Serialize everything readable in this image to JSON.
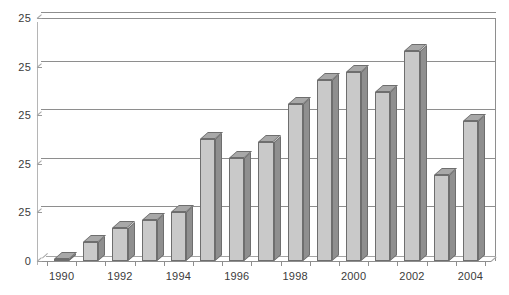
{
  "chart_data": {
    "type": "bar",
    "title": "",
    "xlabel": "",
    "ylabel": "",
    "grid": true,
    "legend": false,
    "three_d": true,
    "categories": [
      "1990",
      "1991",
      "1992",
      "1993",
      "1994",
      "1995",
      "1996",
      "1997",
      "1998",
      "1999",
      "2000",
      "2001",
      "2002",
      "2003",
      "2004"
    ],
    "x_tick_labels": [
      "1990",
      "1992",
      "1994",
      "1996",
      "1998",
      "2000",
      "2002",
      "2004"
    ],
    "y_tick_labels": [
      "0",
      "25",
      "25",
      "25",
      "25",
      "25"
    ],
    "ylim": [
      0,
      125
    ],
    "values": [
      1,
      10,
      17,
      21,
      25,
      63,
      53,
      61,
      81,
      93,
      97,
      87,
      108,
      44,
      72
    ],
    "series": [
      {
        "name": "series-1",
        "values": [
          1,
          10,
          17,
          21,
          25,
          63,
          53,
          61,
          81,
          93,
          97,
          87,
          108,
          44,
          72
        ]
      }
    ],
    "colors": {
      "bar_face": "#c9c9c9",
      "bar_side": "#8f8f8f",
      "bar_top": "#a8a8a8",
      "bar_outline": "#6e6e6e",
      "gridline": "#8e8e8e",
      "axis": "#8e8e8e",
      "text": "#3b3b3b",
      "background": "#ffffff"
    }
  }
}
